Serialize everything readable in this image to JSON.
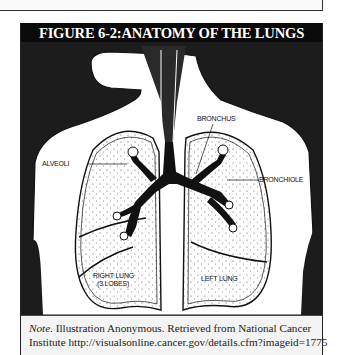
{
  "figure": {
    "title": "FIGURE 6-2:ANATOMY OF THE LUNGS",
    "labels": {
      "bronchus": "BRONCHUS",
      "alveoli": "ALVEOLI",
      "bronchiole": "BRONCHIOLE",
      "right_lung_1": "RIGHT LUNG",
      "right_lung_2": "(3 LOBES)",
      "left_lung": "LEFT LUNG"
    },
    "note": {
      "prefix": "Note.",
      "line1": " Illustration Anonymous. Retrieved from National Cancer",
      "line2": "Institute http://visualsonline.cancer.gov/details.cfm?imageid=1775"
    }
  },
  "colors": {
    "title_bg": "#0a0a0a",
    "title_fg": "#ffffff",
    "note_bg": "#f4f4f4"
  }
}
